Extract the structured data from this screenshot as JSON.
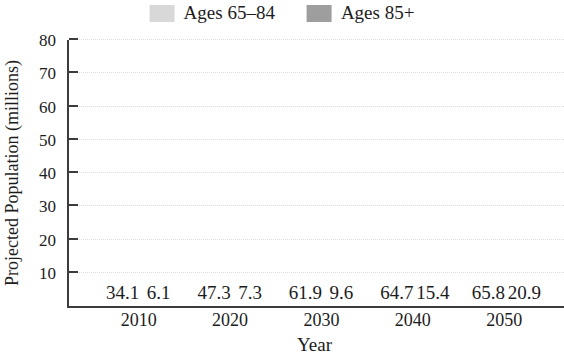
{
  "chart_data": {
    "type": "bar",
    "title": "",
    "categories": [
      "2010",
      "2020",
      "2030",
      "2040",
      "2050"
    ],
    "series": [
      {
        "name": "Ages 65–84",
        "color": "#d8d8d8",
        "values": [
          34.1,
          47.3,
          61.9,
          64.7,
          65.8
        ]
      },
      {
        "name": "Ages 85+",
        "color": "#9e9e9e",
        "values": [
          6.1,
          7.3,
          9.6,
          15.4,
          20.9
        ]
      }
    ],
    "xlabel": "Year",
    "ylabel": "Projected Population (millions)",
    "ylim": [
      0,
      80
    ],
    "yticks": [
      10,
      20,
      30,
      40,
      50,
      60,
      70,
      80
    ],
    "grid": "horizontal-dotted",
    "legend_position": "top-center",
    "value_labels": true
  },
  "colors": {
    "axis": "#3c3c3c",
    "grid": "#dadada",
    "text": "#1c1c1c",
    "background": "#ffffff"
  }
}
